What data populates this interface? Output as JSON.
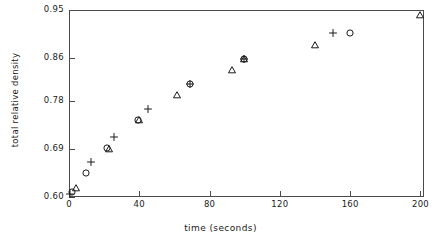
{
  "chart_data": {
    "type": "scatter",
    "title": "",
    "xlabel": "time (seconds)",
    "ylabel": "total relative density",
    "xlim": [
      0,
      202
    ],
    "ylim": [
      0.6,
      0.95
    ],
    "xticks": [
      0,
      40,
      80,
      120,
      160,
      200
    ],
    "xticklabels": [
      "0",
      "40",
      "80",
      "120",
      "160",
      "200"
    ],
    "yticks": [
      0.6,
      0.69,
      0.78,
      0.86,
      0.95
    ],
    "yticklabels": [
      "0.60",
      "0.69",
      "0.78",
      "0.86",
      "0.95"
    ],
    "grid": false,
    "legend": "none",
    "series": [
      {
        "name": "circle-series",
        "marker": "circle",
        "points": [
          {
            "x": 1.5,
            "y": 0.609
          },
          {
            "x": 9.5,
            "y": 0.645
          },
          {
            "x": 21.5,
            "y": 0.692
          },
          {
            "x": 39.0,
            "y": 0.745
          },
          {
            "x": 69.0,
            "y": 0.812
          },
          {
            "x": 99.5,
            "y": 0.858
          },
          {
            "x": 160.0,
            "y": 0.907
          }
        ]
      },
      {
        "name": "triangle-series",
        "marker": "triangle",
        "points": [
          {
            "x": 4.0,
            "y": 0.616
          },
          {
            "x": 22.5,
            "y": 0.69
          },
          {
            "x": 40.0,
            "y": 0.744
          },
          {
            "x": 61.5,
            "y": 0.791
          },
          {
            "x": 92.5,
            "y": 0.838
          },
          {
            "x": 99.5,
            "y": 0.858
          },
          {
            "x": 140.0,
            "y": 0.884
          },
          {
            "x": 200.0,
            "y": 0.941
          }
        ]
      },
      {
        "name": "plus-series",
        "marker": "plus",
        "points": [
          {
            "x": 0.8,
            "y": 0.606
          },
          {
            "x": 12.5,
            "y": 0.665
          },
          {
            "x": 25.5,
            "y": 0.712
          },
          {
            "x": 45.0,
            "y": 0.764
          },
          {
            "x": 69.0,
            "y": 0.812
          },
          {
            "x": 99.5,
            "y": 0.858
          },
          {
            "x": 150.0,
            "y": 0.907
          }
        ]
      }
    ]
  },
  "style": {
    "frame_color": "#4a4a4a",
    "marker_color": "#1a1a1a",
    "background": "#ffffff"
  }
}
